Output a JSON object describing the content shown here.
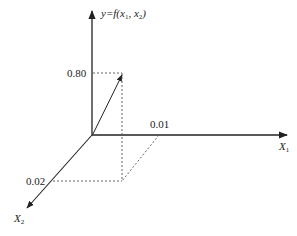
{
  "diagram": {
    "type": "3d-coordinate-vector",
    "axes": {
      "y": {
        "label_prefix": "y=f(x",
        "sub1": "1",
        "mid": ", x",
        "sub2": "2",
        "suffix": ")"
      },
      "x1": {
        "label": "X",
        "sub": "1"
      },
      "x2": {
        "label": "X",
        "sub": "2"
      }
    },
    "ticks": {
      "y_value": "0.80",
      "x1_value": "0.01",
      "x2_value": "0.02"
    },
    "vector": {
      "x1": 0.01,
      "x2": 0.02,
      "y": 0.8
    },
    "colors": {
      "line": "#222222",
      "dashed": "#555555",
      "background": "#ffffff"
    }
  },
  "caption": {
    "visible": "partially clipped, illegible"
  }
}
